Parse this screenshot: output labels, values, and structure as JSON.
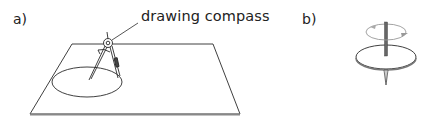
{
  "panels": {
    "a": {
      "label": "a)",
      "callout": "drawing compass"
    },
    "b": {
      "label": "b)"
    }
  },
  "colors": {
    "line": "#2a2a2a",
    "paper_edge": "#777777",
    "spindle": "#555555",
    "arrow": "#999999",
    "background": "#ffffff"
  }
}
